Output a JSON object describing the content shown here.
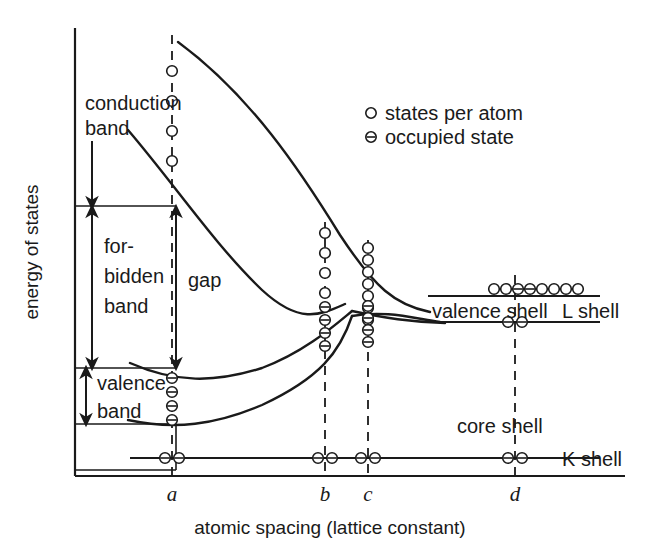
{
  "figure": {
    "domain": "Diagram",
    "kind": "energy-band-vs-atomic-spacing",
    "background_color": "#ffffff",
    "line_color": "#1a1a1a"
  },
  "axes": {
    "y_title": "energy of states",
    "x_title": "atomic spacing (lattice constant)",
    "x_ticks": [
      {
        "label": "a",
        "x": 172
      },
      {
        "label": "b",
        "x": 325
      },
      {
        "label": "c",
        "x": 368
      },
      {
        "label": "d",
        "x": 515
      }
    ]
  },
  "legend": {
    "items": [
      {
        "marker": "open-circle-icon",
        "label": "states per atom"
      },
      {
        "marker": "occupied-circle-icon",
        "label": "occupied state"
      }
    ]
  },
  "band_labels": {
    "conduction_band": "conduction\nband",
    "conduction_band_line1": "conduction",
    "conduction_band_line2": "band",
    "forbidden_band_line1": "for-",
    "forbidden_band_line2": "bidden",
    "forbidden_band_line3": "band",
    "gap": "gap",
    "valence_band_line1": "valence",
    "valence_band_line2": "band"
  },
  "shell_labels": {
    "valence_shell": "valence shell",
    "l_shell": "L shell",
    "core_shell": "core shell",
    "k_shell": "K shell"
  },
  "state_columns": [
    {
      "name": "column-a",
      "x": 172,
      "groups": [
        {
          "type": "states per atom",
          "count": 4,
          "occupied": false,
          "ys": [
            71,
            101,
            131,
            161
          ]
        },
        {
          "type": "occupied state",
          "count": 4,
          "occupied": true,
          "ys": [
            378,
            392,
            406,
            420
          ]
        },
        {
          "type": "occupied state",
          "count": 2,
          "occupied": true,
          "orientation": "horizontal",
          "xs": [
            165,
            179
          ],
          "y": 458
        }
      ]
    },
    {
      "name": "column-b",
      "x": 325,
      "groups": [
        {
          "type": "states per atom",
          "count": 4,
          "occupied": false,
          "ys": [
            233,
            253,
            273,
            293
          ]
        },
        {
          "type": "occupied state",
          "count": 4,
          "occupied": true,
          "ys": [
            307,
            320,
            333,
            346
          ]
        },
        {
          "type": "occupied state",
          "count": 2,
          "occupied": true,
          "orientation": "horizontal",
          "xs": [
            318,
            332
          ],
          "y": 458
        }
      ]
    },
    {
      "name": "column-c",
      "x": 368,
      "groups": [
        {
          "type": "states per atom",
          "count": 7,
          "occupied": false,
          "ys": [
            248,
            260,
            272,
            284,
            296,
            308,
            320
          ]
        },
        {
          "type": "occupied state",
          "count": 4,
          "occupied": true,
          "ys": [
            306,
            318,
            330,
            342
          ]
        },
        {
          "type": "occupied state",
          "count": 2,
          "occupied": true,
          "orientation": "horizontal",
          "xs": [
            361,
            375
          ],
          "y": 458
        }
      ]
    },
    {
      "name": "column-d",
      "x": 515,
      "groups": [
        {
          "type": "states per atom",
          "count": 8,
          "occupied": false,
          "orientation": "horizontal",
          "xs": [
            494,
            506,
            518,
            530,
            542,
            554,
            566,
            578
          ],
          "y": 289,
          "occupied_indices": [
            2,
            3
          ]
        },
        {
          "type": "occupied state",
          "count": 2,
          "occupied": true,
          "orientation": "horizontal",
          "xs": [
            508,
            522
          ],
          "y": 322
        },
        {
          "type": "occupied state",
          "count": 2,
          "occupied": true,
          "orientation": "horizontal",
          "xs": [
            508,
            522
          ],
          "y": 458
        }
      ]
    }
  ]
}
